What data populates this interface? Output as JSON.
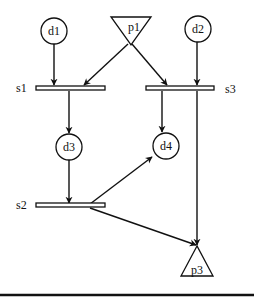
{
  "diagram": {
    "colors": {
      "stroke": "#111111",
      "background": "#ffffff"
    },
    "nodes": {
      "d1": {
        "label": "d1",
        "shape": "circle"
      },
      "d2": {
        "label": "d2",
        "shape": "circle"
      },
      "d3": {
        "label": "d3",
        "shape": "circle"
      },
      "d4": {
        "label": "d4",
        "shape": "circle"
      },
      "p1": {
        "label": "p1",
        "shape": "inverted-triangle"
      },
      "p3": {
        "label": "p3",
        "shape": "triangle"
      },
      "s1": {
        "label": "s1",
        "shape": "bar"
      },
      "s2": {
        "label": "s2",
        "shape": "bar"
      },
      "s3": {
        "label": "s3",
        "shape": "bar"
      }
    },
    "edges": [
      {
        "from": "d1",
        "to": "s1"
      },
      {
        "from": "p1",
        "to": "s1"
      },
      {
        "from": "p1",
        "to": "s3"
      },
      {
        "from": "d2",
        "to": "s3"
      },
      {
        "from": "s1",
        "to": "d3"
      },
      {
        "from": "s3",
        "to": "d4"
      },
      {
        "from": "s3",
        "to": "p3"
      },
      {
        "from": "d3",
        "to": "s2"
      },
      {
        "from": "s2",
        "to": "d4"
      },
      {
        "from": "s2",
        "to": "p3"
      }
    ]
  }
}
